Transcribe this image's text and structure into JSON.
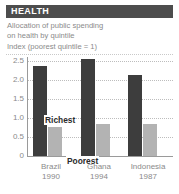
{
  "header": {
    "title": "HEALTH"
  },
  "subtitle": {
    "line1": "Allocation of public spending",
    "line2": "on health by quintile"
  },
  "index_note": "Index (poorest quintile = 1)",
  "series_labels": {
    "richest": "Richest",
    "poorest": "Poorest"
  },
  "colors": {
    "header_bg": "#4d4d4d",
    "header_text": "#ffffff",
    "richest_bar": "#3d3d3d",
    "poorest_bar": "#b3b3b3",
    "muted_text": "#8a8a8a",
    "gridline": "#bdbdbd",
    "axis": "#9a9a9a"
  },
  "chart_data": {
    "type": "bar",
    "title": "Allocation of public spending on health by quintile",
    "xlabel": "",
    "ylabel": "Index (poorest quintile = 1)",
    "categories": [
      "Brazil",
      "Ghana",
      "Indonesia"
    ],
    "category_years": [
      "1990",
      "1994",
      "1987"
    ],
    "series": [
      {
        "name": "Richest",
        "values": [
          2.5,
          2.7,
          2.25
        ]
      },
      {
        "name": "Poorest",
        "values": [
          0.8,
          0.9,
          0.9
        ]
      }
    ],
    "ylim": [
      0,
      2.75
    ],
    "yticks": [
      0,
      0.5,
      1.0,
      1.5,
      2.0,
      2.5
    ],
    "ytick_labels": [
      "0",
      "0.5",
      "1.0",
      "1.5",
      "2.0",
      "2.5"
    ],
    "grid": true,
    "legend_position": "inline-annotations"
  }
}
